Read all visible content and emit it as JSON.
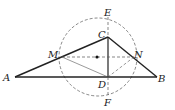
{
  "diagram": {
    "type": "geometry",
    "points": {
      "A": {
        "label": "A",
        "x": 15,
        "y": 77
      },
      "B": {
        "label": "B",
        "x": 157,
        "y": 77
      },
      "C": {
        "label": "C",
        "x": 108,
        "y": 37
      },
      "D": {
        "label": "D",
        "x": 108,
        "y": 77
      },
      "M": {
        "label": "M",
        "x": 62,
        "y": 57
      },
      "N": {
        "label": "N",
        "x": 134,
        "y": 57
      },
      "E": {
        "label": "E",
        "x": 108,
        "y": 17
      },
      "F": {
        "label": "F",
        "x": 108,
        "y": 96
      },
      "O": {
        "x": 97,
        "y": 57
      }
    },
    "circle": {
      "cx": 98,
      "cy": 57,
      "r": 39,
      "style": "dashed"
    },
    "solid_segments": [
      "AB",
      "AC",
      "CB",
      "CD"
    ],
    "dashed_segments": [
      "MN",
      "MD",
      "ND",
      "EC",
      "DF"
    ],
    "colors": {
      "stroke": "#222222",
      "dashed": "#555555"
    }
  }
}
